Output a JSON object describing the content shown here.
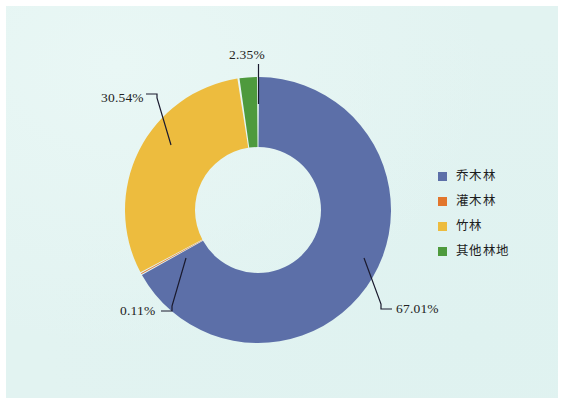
{
  "figure": {
    "background_color": "#e2f3f1",
    "frame_color": "#ffffff"
  },
  "legend": {
    "position": "right",
    "items": [
      {
        "label": "乔木林",
        "color": "#5c6fa8",
        "swatch_name": "legend-swatch-qiaomulin"
      },
      {
        "label": "灌木林",
        "color": "#e2762c",
        "swatch_name": "legend-swatch-guanmulin"
      },
      {
        "label": "竹林",
        "color": "#edbc3e",
        "swatch_name": "legend-swatch-zhulin"
      },
      {
        "label": "其他林地",
        "color": "#4e9a3d",
        "swatch_name": "legend-swatch-qitalindi"
      }
    ]
  },
  "labels": {
    "green": "2.35%",
    "yellow": "30.54%",
    "orange": "0.11%",
    "blue": "67.01%"
  },
  "chart_data": {
    "type": "pie",
    "variant": "donut",
    "title": "",
    "subtitle": "",
    "xlabel": "",
    "ylabel": "",
    "grid": false,
    "legend_position": "right",
    "start_angle_deg": 0,
    "direction": "clockwise",
    "center": {
      "x": 258,
      "y": 210
    },
    "outer_radius": 133,
    "inner_radius": 63,
    "categories": [
      "乔木林",
      "灌木林",
      "竹林",
      "其他林地"
    ],
    "values": [
      67.01,
      0.11,
      30.54,
      2.35
    ],
    "colors": [
      "#5c6fa8",
      "#e2762c",
      "#edbc3e",
      "#4e9a3d"
    ],
    "data_labels": [
      "67.01%",
      "0.11%",
      "30.54%",
      "2.35%"
    ],
    "units": "percent",
    "total": 100.01,
    "slices": [
      {
        "name": "乔木林",
        "value": 67.01,
        "label": "67.01%",
        "color": "#5c6fa8"
      },
      {
        "name": "灌木林",
        "value": 0.11,
        "label": "0.11%",
        "color": "#e2762c"
      },
      {
        "name": "竹林",
        "value": 30.54,
        "label": "30.54%",
        "color": "#edbc3e"
      },
      {
        "name": "其他林地",
        "value": 2.35,
        "label": "2.35%",
        "color": "#4e9a3d"
      }
    ]
  }
}
